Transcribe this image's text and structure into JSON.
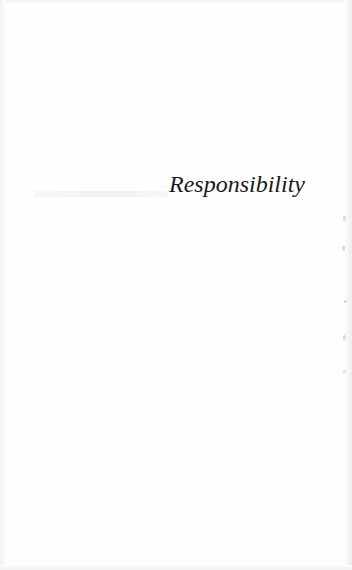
{
  "page": {
    "type": "half-title",
    "title": "Responsibility",
    "text_color": "#1a1a1a",
    "background_color": "#fefefe"
  }
}
